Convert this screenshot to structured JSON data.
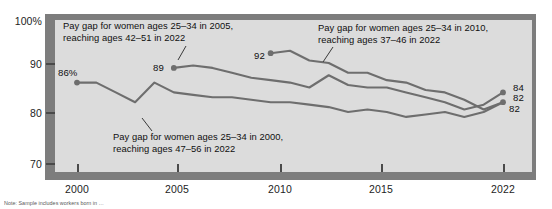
{
  "chart_data": {
    "type": "line",
    "title": "",
    "xlabel": "",
    "ylabel": "",
    "xlim": [
      1998.8,
      2022.8
    ],
    "ylim": [
      67,
      100
    ],
    "yticks": [
      100,
      90,
      80,
      70
    ],
    "ytick_labels": [
      "100%",
      "90",
      "80",
      "70"
    ],
    "xticks": [
      2000,
      2005,
      2010,
      2015,
      2022
    ],
    "xtick_labels": [
      "2000",
      "2005",
      "2010",
      "2015",
      "2022"
    ],
    "grid": false,
    "legend": "none",
    "line_color": "#6e6e6e",
    "plot_bg": "#dcdcdc",
    "frame_color": "#7d7d7d",
    "series": [
      {
        "name": "Pay gap for women ages 25-34 in 2000, reaching ages 47-56 in 2022",
        "start_label": "86%",
        "end_label": "82",
        "x": [
          2000,
          2001,
          2002,
          2003,
          2004,
          2005,
          2006,
          2007,
          2008,
          2009,
          2010,
          2011,
          2012,
          2013,
          2014,
          2015,
          2016,
          2017,
          2018,
          2019,
          2020,
          2021,
          2022
        ],
        "values": [
          86,
          86,
          84,
          82,
          86,
          84,
          83.5,
          83,
          83,
          82.5,
          82,
          82,
          81.5,
          81,
          80,
          80.5,
          80,
          79,
          79.5,
          80,
          79,
          80,
          82
        ]
      },
      {
        "name": "Pay gap for women ages 25-34 in 2005, reaching ages 42-51 in 2022",
        "start_label": "89",
        "end_label": "84",
        "x": [
          2005,
          2006,
          2007,
          2008,
          2009,
          2010,
          2011,
          2012,
          2013,
          2014,
          2015,
          2016,
          2017,
          2018,
          2019,
          2020,
          2021,
          2022
        ],
        "values": [
          89,
          89.5,
          89,
          88,
          87,
          86.5,
          86,
          85,
          87.5,
          85.5,
          85,
          85,
          84,
          83,
          82,
          80.5,
          81.5,
          84
        ]
      },
      {
        "name": "Pay gap for women ages 25-34 in 2010, reaching ages 37-46 in 2022",
        "start_label": "92",
        "end_label": "82",
        "x": [
          2010,
          2011,
          2012,
          2013,
          2014,
          2015,
          2016,
          2017,
          2018,
          2019,
          2020,
          2021,
          2022
        ],
        "values": [
          92,
          92.5,
          90.5,
          90,
          88,
          88,
          86.5,
          86,
          84.5,
          84,
          82.5,
          80.5,
          82
        ]
      }
    ]
  },
  "annotations": {
    "a2005": "Pay gap for women ages 25–34 in 2005,\nreaching ages 42–51 in 2022",
    "a2010": "Pay gap for women ages 25–34 in 2010,\nreaching ages 37–46 in 2022",
    "a2000": "Pay gap for women ages 25–34 in 2000,\nreaching ages 47–56 in 2022"
  },
  "value_labels": {
    "start_2000": "86%",
    "start_2005": "89",
    "start_2010": "92",
    "end_2005_series": "84",
    "end_2010_series": "82",
    "end_2000_series": "82"
  },
  "axis": {
    "y": [
      "100%",
      "90",
      "80",
      "70"
    ],
    "x": [
      "2000",
      "2005",
      "2010",
      "2015",
      "2022"
    ]
  },
  "footnote": {
    "text": "Note: Sample includes workers born in …"
  }
}
